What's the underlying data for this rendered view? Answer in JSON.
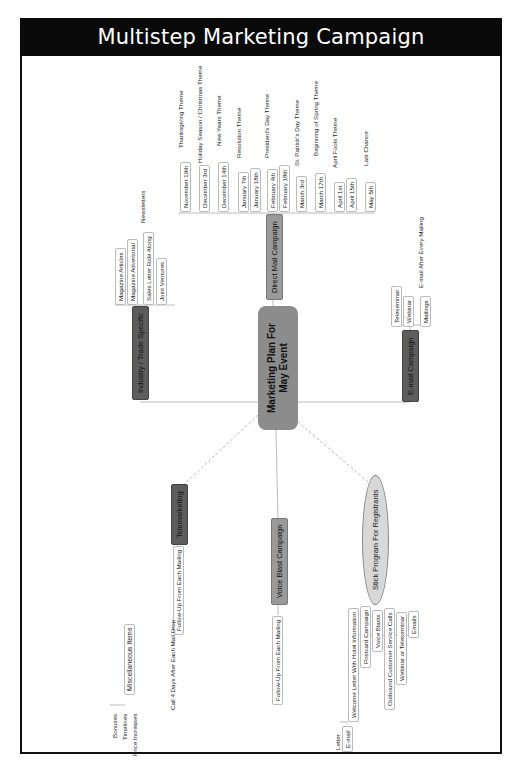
{
  "title": "Multistep Marketing Campaign",
  "center": {
    "label": "Marketing Plan For May Event"
  },
  "branches": {
    "direct_mail": {
      "label": "Direct Mail Campaign",
      "dates": [
        {
          "date": "November 19th",
          "theme": "Thanksgiving Theme"
        },
        {
          "date": "December 3rd",
          "theme": "Holiday Season / Christmas Theme"
        },
        {
          "date": "December 14th",
          "theme": "New Years Theme"
        },
        {
          "date": "January 7th",
          "theme": "Resolution Theme"
        },
        {
          "date": "January 18th",
          "theme": ""
        },
        {
          "date": "February 4th",
          "theme": "President's Day Theme"
        },
        {
          "date": "February 18th",
          "theme": ""
        },
        {
          "date": "March 3rd",
          "theme": "St. Patrick's Day Theme"
        },
        {
          "date": "March 17th",
          "theme": "Beginning of Spring Theme"
        },
        {
          "date": "April 1st",
          "theme": "April Fools Theme"
        },
        {
          "date": "April 15th",
          "theme": ""
        },
        {
          "date": "May 5th",
          "theme": "Last Chance"
        }
      ]
    },
    "industry": {
      "label": "Industry / Trade Specific",
      "items": [
        "Magazine Articles",
        "Magazine Advertorial",
        "Sales Letter Ride Along",
        "Joint Ventures"
      ],
      "sub_note": "Newsletters"
    },
    "email": {
      "label": "E-mail Campaign",
      "items": [
        "Teleseminar",
        "Webinar",
        "Mailings"
      ],
      "sub_note": "E-mail After Every Mailing"
    },
    "telemarketing": {
      "label": "Telemarketing",
      "item": "Follow-Up From Each Mailing",
      "sub_note": "Call 4 Days After Each Mail Drop"
    },
    "voice_blast": {
      "label": "Voice Blast Campaign",
      "item": "Follow-Up From Each Mailing"
    },
    "stick_program": {
      "label": "Stick Program For Registrants",
      "items": [
        "Welcome Letter With Hotel Information",
        "Postcard Campaign",
        "Voice Blasts",
        "Outbound Customer Service Calls",
        "Webinar or Teleseminar",
        "Emails"
      ],
      "welcome_sub": [
        "Letter",
        "E-mail"
      ]
    },
    "misc": {
      "label": "Miscellaneous Items",
      "items": [
        "Bonuses",
        "Timelines",
        "Price Increases"
      ]
    }
  }
}
